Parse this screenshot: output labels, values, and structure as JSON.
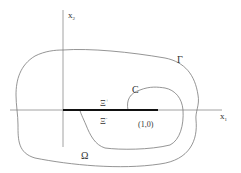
{
  "diagram": {
    "axes": {
      "vertical_label": "x",
      "vertical_sub": "2",
      "horizontal_label": "x",
      "horizontal_sub": "1"
    },
    "labels": {
      "outer_boundary": "Γ",
      "inner_curve": "C",
      "upper_side": "Ξ",
      "upper_sup": "+",
      "lower_side": "Ξ",
      "lower_sup": "-",
      "point": "(1,0)",
      "domain": "Ω"
    },
    "colors": {
      "line": "#7a7a7a",
      "segment": "#111111",
      "text": "#333333"
    }
  }
}
